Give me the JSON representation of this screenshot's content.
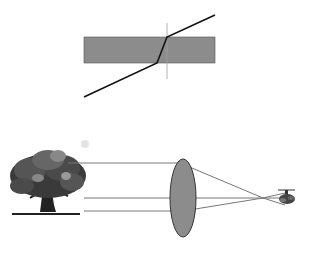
{
  "figures": {
    "refraction": {
      "description": "Light ray refracting through a rectangular glass slab",
      "slab_color": "#8c8c8c",
      "ray_color": "#111111",
      "normal_color": "#999999"
    },
    "lens": {
      "description": "Converging lens forming an inverted image of a tree",
      "lens_color": "#8c8c8c",
      "ray_color": "#777777",
      "object": "tree",
      "image": "inverted-tree"
    }
  }
}
